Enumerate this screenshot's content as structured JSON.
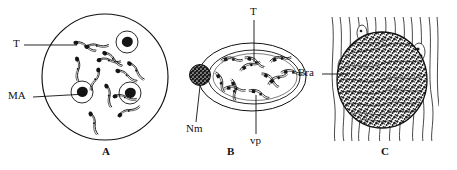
{
  "figure": {
    "background_color": "#ffffff",
    "ink_color": "#111111",
    "panel_count": 3
  },
  "panels": [
    {
      "id": "A",
      "letter": "A",
      "description": "Circular blood-smear field containing trypomastigotes and host cells with dark nuclei",
      "shape": "circle",
      "callouts": [
        {
          "key": "T",
          "label": "T",
          "meaning": "trypomastigote"
        },
        {
          "key": "MA",
          "label": "MA",
          "meaning": "macrophage / host cell"
        }
      ]
    },
    {
      "id": "B",
      "letter": "B",
      "description": "Oval pseudocyst in cross-section with parasitophorous vacuole, host cell nucleus and amastigotes",
      "shape": "ellipse",
      "callouts": [
        {
          "key": "T",
          "label": "T",
          "meaning": "trypomastigote"
        },
        {
          "key": "Nm",
          "label": "Nm",
          "meaning": "nucleus of host cell"
        },
        {
          "key": "vp",
          "label": "vp",
          "meaning": "parasitophorous vacuole"
        }
      ]
    },
    {
      "id": "C",
      "letter": "C",
      "description": "Muscle tissue section with dense granular parasite mass among striated fibres",
      "shape": "tissue-section",
      "callouts": [
        {
          "key": "Bra",
          "label": "Bra",
          "meaning": "parasite mass / brood"
        }
      ]
    }
  ],
  "labels": {
    "panelA_T": "T",
    "panelA_MA": "MA",
    "panelA_letter": "A",
    "panelB_T": "T",
    "panelB_Nm": "Nm",
    "panelB_vp": "vp",
    "panelB_letter": "B",
    "panelC_Bra": "Bra",
    "panelC_letter": "C"
  },
  "colors": {
    "ink": "#111111",
    "fill_dark": "#1a1a1a",
    "paper": "#ffffff"
  }
}
